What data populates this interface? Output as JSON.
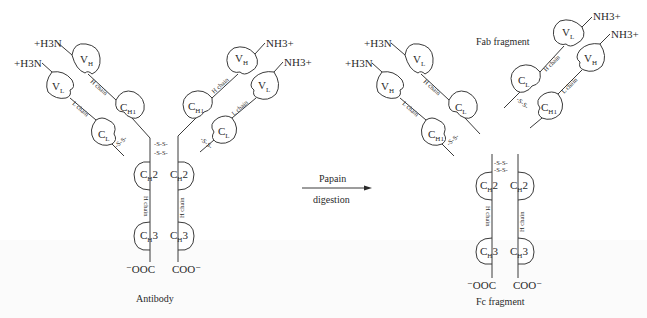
{
  "figure": {
    "background": "#ffffff",
    "line_color": "#3a3a3a"
  },
  "antibody": {
    "caption": "Antibody",
    "left_arm": {
      "n_term_heavy": "+H3N",
      "n_term_light": "+H3N",
      "domains": {
        "vh": "V",
        "vh_sub": "H",
        "vl": "V",
        "vl_sub": "L",
        "ch1": "C",
        "ch1_sub": "H1",
        "cl": "C",
        "cl_sub": "L"
      },
      "h_chain": "H chain",
      "l_chain": "L chain",
      "disulfide": "-S-S-"
    },
    "right_arm": {
      "n_term_heavy": "NH3+",
      "n_term_light": "NH3+",
      "domains": {
        "vh": "V",
        "vh_sub": "H",
        "vl": "V",
        "vl_sub": "L",
        "ch1": "C",
        "ch1_sub": "H1",
        "cl": "C",
        "cl_sub": "L"
      },
      "h_chain": "H chain",
      "l_chain": "L chain",
      "disulfide": "-S-S-"
    },
    "hinge": [
      "-S-S-",
      "-S-S-"
    ],
    "stem": {
      "ch2": "C",
      "ch2_sub": "H",
      "ch2_num": "2",
      "ch3": "C",
      "ch3_sub": "H",
      "ch3_num": "3",
      "h_chain": "H chain",
      "c_term_left": "⁻OOC",
      "c_term_right": "COO⁻"
    }
  },
  "arrow": {
    "label_top": "Papain",
    "label_bottom": "digestion"
  },
  "fab": {
    "caption": "Fab fragment",
    "left": {
      "n_term_1": "+H3N",
      "n_term_2": "+H3N",
      "domains": {
        "top": "V",
        "top_sub": "L",
        "lower": "V",
        "lower_sub": "H",
        "c_upper": "C",
        "c_upper_sub": "L",
        "c_lower": "C",
        "c_lower_sub": "H1"
      },
      "chain_upper": "H chain",
      "chain_lower": "L chain",
      "disulfide": "-S-S-"
    },
    "right": {
      "n_term_1": "NH3+",
      "n_term_2": "NH3+",
      "domains": {
        "top": "V",
        "top_sub": "L",
        "lower": "V",
        "lower_sub": "H",
        "c_upper": "C",
        "c_upper_sub": "L",
        "c_lower": "C",
        "c_lower_sub": "H1"
      },
      "chain_upper": "H chain",
      "chain_lower": "L chain",
      "disulfide": "-S-S-"
    }
  },
  "fc": {
    "caption": "Fc fragment",
    "hinge": [
      "-S-S-",
      "-S-S-"
    ],
    "ch2": "C",
    "ch2_sub": "H",
    "ch2_num": "2",
    "ch3": "C",
    "ch3_sub": "H",
    "ch3_num": "3",
    "h_chain": "H chain",
    "c_term_left": "⁻OOC",
    "c_term_right": "COO⁻"
  }
}
